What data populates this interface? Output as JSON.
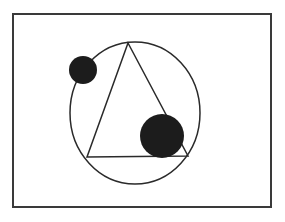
{
  "diagram": {
    "frame": {
      "x": 13,
      "y": 14,
      "width": 258,
      "height": 193,
      "stroke": "#3a3a3a"
    },
    "circle": {
      "cx": 135,
      "cy": 113,
      "rx": 65,
      "ry": 71,
      "stroke": "#2a2a2a"
    },
    "triangle": {
      "vertices": [
        [
          128,
          43
        ],
        [
          87,
          157
        ],
        [
          188,
          156
        ]
      ],
      "stroke": "#2a2a2a"
    },
    "disks": [
      {
        "name": "small-disk",
        "cx": 83,
        "cy": 70,
        "r": 14,
        "fill": "#1c1c1c"
      },
      {
        "name": "large-disk",
        "cx": 162,
        "cy": 136,
        "r": 22,
        "fill": "#1c1c1c"
      }
    ]
  }
}
